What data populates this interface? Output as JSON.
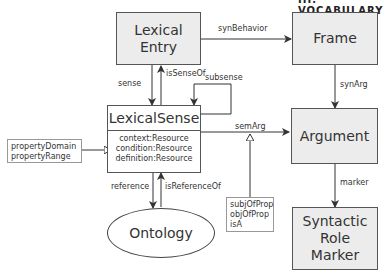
{
  "diagram": {
    "cutoff_header": "III. VOCABULARY",
    "nodes": {
      "lexical_entry": {
        "line1": "Lexical",
        "line2": "Entry"
      },
      "frame": {
        "label": "Frame"
      },
      "lexical_sense": {
        "title": "LexicalSense",
        "attributes": [
          "context:Resource",
          "condition:Resource",
          "definition:Resource"
        ]
      },
      "argument": {
        "label": "Argument"
      },
      "ontology": {
        "label": "Ontology"
      },
      "syntactic_role_marker": {
        "line1": "Syntactic",
        "line2": "Role",
        "line3": "Marker"
      }
    },
    "notes": {
      "property_note": [
        "propertyDomain",
        "propertyRange"
      ],
      "semarg_note": [
        "subjOfProp",
        "objOfProp",
        "isA"
      ]
    },
    "edges": {
      "synBehavior": "synBehavior",
      "synArg": "synArg",
      "sense": "sense",
      "isSenseOf": "isSenseOf",
      "subsense": "subsense",
      "semArg": "semArg",
      "marker": "marker",
      "reference": "reference",
      "isReferenceOf": "isReferenceOf"
    },
    "colors": {
      "box_fill": "#ececec",
      "border": "#555555",
      "text": "#333333"
    }
  }
}
